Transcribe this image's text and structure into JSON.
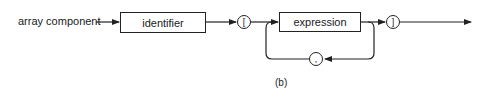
{
  "diagram": {
    "type": "syntax-diagram",
    "rule_name": "array component",
    "nodes": {
      "identifier": "identifier",
      "open_bracket": "[",
      "expression": "expression",
      "separator": ",",
      "close_bracket": "]"
    },
    "caption": "(b)",
    "line_color": "#222222"
  }
}
